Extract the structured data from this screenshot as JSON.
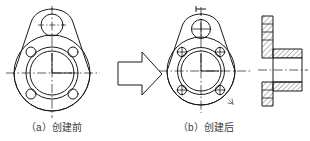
{
  "figure": {
    "name": "flange-plate-before-after",
    "captions": {
      "before": "（a）创建前",
      "after": "（b）创建后"
    },
    "colors": {
      "line": "#1a1a1a",
      "centerline": "#1a1a1a",
      "hatch": "#1a1a1a",
      "background": "#ffffff",
      "caption_text": "#3c3c3c"
    },
    "panels": [
      {
        "id": "before",
        "label": "flange-front-view-before",
        "description": "pear-shaped flange plate front view, outline only",
        "features": {
          "top_hole_count": 1,
          "bolt_hole_count": 4,
          "center_bore_count": 2,
          "centerlines": true,
          "holes_filled": false
        }
      },
      {
        "id": "arrow",
        "label": "transform-arrow",
        "description": "hollow right pointing block arrow",
        "direction": "right"
      },
      {
        "id": "after",
        "label": "flange-front-view-after",
        "description": "pear-shaped flange plate front view with thread crosshair marks in holes",
        "features": {
          "top_hole_count": 1,
          "bolt_hole_count": 4,
          "center_bore_count": 2,
          "centerlines": true,
          "holes_filled": true
        }
      },
      {
        "id": "section",
        "label": "flange-section-view",
        "description": "hatched full section side view of flange with hub",
        "features": {
          "hatching": true,
          "centerline": true
        }
      }
    ]
  }
}
